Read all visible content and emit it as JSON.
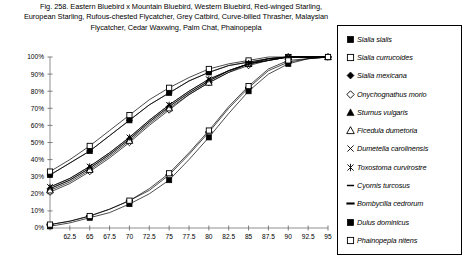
{
  "figure": {
    "caption_lines": [
      "Fig. 258.  Eastern Bluebird x Mountain Bluebird, Western Bluebird, Red-winged Starling,",
      "European Starling, Rufous-chested Flycatcher, Grey Catbird, Curve-billed Thrasher, Malaysian",
      "Flycatcher, Cedar Waxwing, Palm Chat, Phainopepla"
    ],
    "number": "Fig. 258."
  },
  "chart_data": {
    "type": "line",
    "title": "",
    "xlabel": "",
    "ylabel": "",
    "xlim": [
      60,
      95
    ],
    "ylim": [
      0,
      100
    ],
    "grid": false,
    "legend_position": "right",
    "x": [
      60,
      62.5,
      65,
      67.5,
      70,
      72.5,
      75,
      77.5,
      80,
      82.5,
      85,
      87.5,
      90,
      92.5,
      95
    ],
    "xtick_labels": [
      "",
      "62.5",
      "65",
      "67.5",
      "70",
      "72.5",
      "75",
      "77.5",
      "80",
      "82.5",
      "85",
      "87.5",
      "90",
      "92.5",
      "95"
    ],
    "ytick_labels": [
      "0%",
      "10%",
      "20%",
      "30%",
      "40%",
      "50%",
      "60%",
      "70%",
      "80%",
      "90%",
      "100%"
    ],
    "ytick_values": [
      0,
      10,
      20,
      30,
      40,
      50,
      60,
      70,
      80,
      90,
      100
    ],
    "series": [
      {
        "name": "Sialia sialis",
        "marker": "filled-square",
        "values": [
          31,
          38,
          45,
          54,
          63,
          72,
          79,
          86,
          91,
          95,
          97,
          99,
          100,
          100,
          100
        ]
      },
      {
        "name": "Sialia currucoides",
        "marker": "open-square",
        "values": [
          33,
          40,
          48,
          57,
          66,
          75,
          82,
          88,
          93,
          96,
          98,
          100,
          100,
          100,
          100
        ]
      },
      {
        "name": "Sialia mexicana",
        "marker": "filled-diamond",
        "values": [
          23,
          28,
          35,
          43,
          52,
          62,
          71,
          79,
          86,
          92,
          96,
          98,
          100,
          100,
          100
        ]
      },
      {
        "name": "Onychognathus morio",
        "marker": "open-diamond",
        "values": [
          21,
          26,
          33,
          41,
          50,
          60,
          69,
          78,
          85,
          91,
          95,
          98,
          100,
          100,
          100
        ]
      },
      {
        "name": "Sturnus vulgaris",
        "marker": "filled-triangle",
        "values": [
          23,
          28,
          35,
          43,
          52,
          62,
          71,
          79,
          86,
          92,
          96,
          98,
          100,
          100,
          100
        ]
      },
      {
        "name": "Ficedula dumetoria",
        "marker": "open-triangle",
        "values": [
          22,
          27,
          34,
          42,
          51,
          61,
          70,
          78,
          85,
          91,
          96,
          98,
          100,
          100,
          100
        ]
      },
      {
        "name": "Dumetella carolinensis",
        "marker": "cross",
        "values": [
          24,
          29,
          36,
          44,
          53,
          63,
          72,
          80,
          87,
          92,
          96,
          99,
          100,
          100,
          100
        ]
      },
      {
        "name": "Toxostoma curvirostre",
        "marker": "asterisk",
        "values": [
          24,
          29,
          36,
          44,
          53,
          63,
          72,
          80,
          87,
          92,
          96,
          99,
          100,
          100,
          100
        ]
      },
      {
        "name": "Cyornis turcosus",
        "marker": "dash",
        "values": [
          31,
          38,
          45,
          54,
          63,
          72,
          79,
          86,
          91,
          95,
          97,
          99,
          100,
          100,
          100
        ]
      },
      {
        "name": "Bombycilla cedrorum",
        "marker": "dash-bold",
        "values": [
          2,
          4,
          7,
          11,
          16,
          22,
          31,
          43,
          56,
          70,
          82,
          92,
          97,
          99,
          100
        ]
      },
      {
        "name": "Dulus dominicus",
        "marker": "filled-square",
        "values": [
          1,
          3,
          6,
          9,
          14,
          20,
          28,
          40,
          53,
          67,
          80,
          90,
          96,
          99,
          100
        ]
      },
      {
        "name": "Phainopepla nitens",
        "marker": "open-square",
        "values": [
          2,
          4,
          7,
          11,
          16,
          23,
          32,
          44,
          57,
          71,
          83,
          93,
          98,
          99,
          100
        ]
      }
    ]
  },
  "legend": {
    "items": [
      {
        "label": "Sialia sialis",
        "marker": "filled-square"
      },
      {
        "label": "Sialia currucoides",
        "marker": "open-square"
      },
      {
        "label": "Sialia mexicana",
        "marker": "filled-diamond"
      },
      {
        "label": "Onychognathus morio",
        "marker": "open-diamond"
      },
      {
        "label": "Sturnus vulgaris",
        "marker": "filled-triangle"
      },
      {
        "label": "Ficedula dumetoria",
        "marker": "open-triangle"
      },
      {
        "label": "Dumetella carolinensis",
        "marker": "cross"
      },
      {
        "label": "Toxostoma curvirostre",
        "marker": "asterisk"
      },
      {
        "label": "Cyornis turcosus",
        "marker": "dash"
      },
      {
        "label": "Bombycilla cedrorum",
        "marker": "dash-bold"
      },
      {
        "label": "Dulus dominicus",
        "marker": "filled-square"
      },
      {
        "label": "Phainopepla nitens",
        "marker": "open-square"
      }
    ]
  },
  "colors": {
    "line": "#000000",
    "axis": "#808080",
    "background": "#ffffff"
  }
}
